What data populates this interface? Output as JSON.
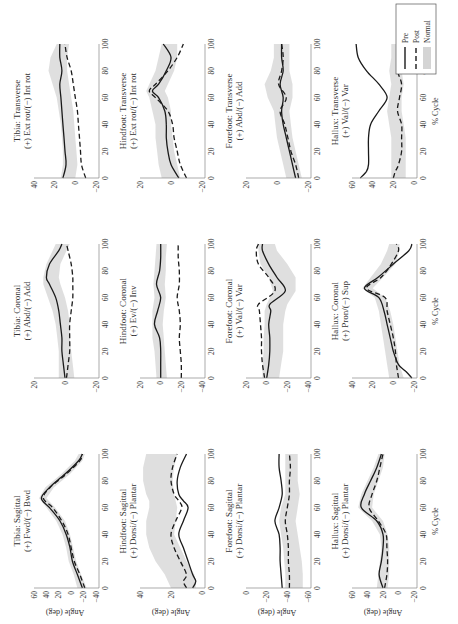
{
  "figure": {
    "legend": [
      {
        "label": "Pre",
        "style": "solid"
      },
      {
        "label": "Post",
        "style": "dashed"
      },
      {
        "label": "Normal",
        "style": "band"
      }
    ],
    "ylabel": "Angle (deg)",
    "xlabel": "% Cycle",
    "colors": {
      "line": "#1a1a1a",
      "band": "#d4d4d4",
      "axis": "#888888"
    }
  },
  "chart_data": [
    {
      "type": "line",
      "title": "Tibia: Sagittal",
      "subtitle": "(+) Fwd/(−) Bwd",
      "xlabel": "",
      "ylabel": "Angle (deg)",
      "xlim": [
        0,
        100
      ],
      "ylim": [
        -40,
        60
      ],
      "xticks": [
        0,
        20,
        40,
        60,
        80,
        100
      ],
      "yticks": [
        60,
        40,
        20,
        0,
        -20,
        -40
      ],
      "x": [
        0,
        10,
        20,
        30,
        40,
        50,
        60,
        67,
        75,
        85,
        95,
        100
      ],
      "series": [
        {
          "name": "Pre",
          "values": [
            -18,
            -10,
            -2,
            2,
            8,
            18,
            35,
            48,
            35,
            10,
            -12,
            -18
          ]
        },
        {
          "name": "Post",
          "values": [
            -22,
            -14,
            -5,
            0,
            5,
            15,
            30,
            45,
            34,
            8,
            -14,
            -18
          ]
        }
      ],
      "normal_band": {
        "lower": [
          -25,
          -16,
          -8,
          -3,
          2,
          10,
          26,
          40,
          28,
          2,
          -18,
          -22
        ],
        "upper": [
          -10,
          -4,
          4,
          8,
          14,
          24,
          40,
          52,
          42,
          16,
          -6,
          -12
        ]
      }
    },
    {
      "type": "line",
      "title": "Tibia: Coronal",
      "subtitle": "(+) Abd/(−) Add",
      "xlim": [
        0,
        100
      ],
      "ylim": [
        -20,
        20
      ],
      "xticks": [
        0,
        20,
        40,
        60,
        80,
        100
      ],
      "yticks": [
        20,
        0,
        -20
      ],
      "x": [
        0,
        10,
        20,
        30,
        40,
        50,
        60,
        70,
        75,
        85,
        95,
        100
      ],
      "series": [
        {
          "name": "Pre",
          "values": [
            0,
            1,
            2,
            2,
            3,
            4,
            6,
            10,
            12,
            10,
            4,
            2
          ]
        },
        {
          "name": "Post",
          "values": [
            -1,
            -2,
            -3,
            -3,
            -3,
            -4,
            -5,
            -5,
            -5,
            -4,
            -2,
            -1
          ]
        }
      ],
      "normal_band": {
        "lower": [
          -6,
          -5,
          -4,
          -3,
          -3,
          -2,
          0,
          3,
          4,
          3,
          -1,
          -3
        ],
        "upper": [
          4,
          4,
          4,
          5,
          6,
          8,
          11,
          14,
          14,
          12,
          8,
          6
        ]
      }
    },
    {
      "type": "line",
      "title": "Tibia: Transverse",
      "subtitle": "(+) Ext rot/(−) Int rot",
      "xlim": [
        0,
        100
      ],
      "ylim": [
        -20,
        40
      ],
      "xticks": [
        0,
        20,
        40,
        60,
        80,
        100
      ],
      "yticks": [
        40,
        20,
        0,
        -20
      ],
      "x": [
        0,
        10,
        20,
        30,
        40,
        50,
        60,
        70,
        80,
        90,
        100
      ],
      "series": [
        {
          "name": "Pre",
          "values": [
            12,
            9,
            10,
            11,
            12,
            13,
            14,
            15,
            13,
            15,
            15
          ]
        },
        {
          "name": "Post",
          "values": [
            -10,
            -6,
            -5,
            -4,
            -3,
            -2,
            0,
            2,
            4,
            8,
            10
          ]
        }
      ],
      "normal_band": {
        "lower": [
          0,
          -2,
          -1,
          0,
          1,
          2,
          4,
          6,
          8,
          8,
          6
        ],
        "upper": [
          14,
          12,
          12,
          13,
          14,
          16,
          18,
          22,
          26,
          24,
          18
        ]
      }
    },
    {
      "type": "line",
      "title": "Hindfoot: Sagittal",
      "subtitle": "(+) Dorsi/(−) Plantar",
      "xlim": [
        0,
        100
      ],
      "ylim": [
        0,
        40
      ],
      "xticks": [
        0,
        20,
        40,
        60,
        80,
        100
      ],
      "yticks": [
        40,
        20,
        0
      ],
      "x": [
        0,
        5,
        10,
        20,
        30,
        40,
        50,
        60,
        65,
        70,
        80,
        90,
        100
      ],
      "series": [
        {
          "name": "Pre",
          "values": [
            6,
            4,
            6,
            9,
            12,
            15,
            12,
            9,
            12,
            15,
            16,
            14,
            10
          ]
        },
        {
          "name": "Post",
          "values": [
            10,
            12,
            10,
            14,
            18,
            20,
            17,
            13,
            15,
            18,
            20,
            19,
            16
          ]
        }
      ],
      "normal_band": {
        "lower": [
          4,
          4,
          5,
          10,
          14,
          18,
          17,
          16,
          17,
          18,
          19,
          18,
          16
        ],
        "upper": [
          20,
          22,
          24,
          30,
          34,
          36,
          36,
          34,
          34,
          36,
          38,
          38,
          36
        ]
      }
    },
    {
      "type": "line",
      "title": "Hindfoot: Coronal",
      "subtitle": "(+) Ev/(−) Inv",
      "xlim": [
        0,
        100
      ],
      "ylim": [
        -40,
        20
      ],
      "xticks": [
        0,
        20,
        40,
        60,
        80,
        100
      ],
      "yticks": [
        20,
        0,
        -20,
        -40
      ],
      "x": [
        0,
        10,
        20,
        30,
        40,
        50,
        60,
        70,
        80,
        90,
        100
      ],
      "series": [
        {
          "name": "Pre",
          "values": [
            0,
            0,
            0,
            1,
            6,
            3,
            0,
            4,
            1,
            0,
            0
          ]
        },
        {
          "name": "Post",
          "values": [
            -20,
            -20,
            -19,
            -18,
            -19,
            -18,
            -16,
            -18,
            -18,
            -17,
            -17
          ]
        }
      ],
      "normal_band": {
        "lower": [
          -6,
          -5,
          -4,
          -3,
          -2,
          -3,
          -5,
          -4,
          -5,
          -5,
          -6
        ],
        "upper": [
          4,
          5,
          6,
          8,
          8,
          8,
          6,
          7,
          6,
          5,
          4
        ]
      }
    },
    {
      "type": "line",
      "title": "Hindfoot: Transverse",
      "subtitle": "(+) Ext rot/(−) Int rot",
      "xlim": [
        0,
        100
      ],
      "ylim": [
        -20,
        20
      ],
      "xticks": [
        0,
        20,
        40,
        60,
        80,
        100
      ],
      "yticks": [
        20,
        0,
        -20
      ],
      "x": [
        0,
        10,
        20,
        30,
        40,
        50,
        60,
        65,
        70,
        80,
        90,
        100
      ],
      "series": [
        {
          "name": "Pre",
          "values": [
            -5,
            0,
            2,
            3,
            3,
            4,
            8,
            12,
            8,
            3,
            0,
            5
          ]
        },
        {
          "name": "Post",
          "values": [
            -10,
            -6,
            -4,
            -2,
            -1,
            2,
            10,
            14,
            10,
            2,
            -4,
            -8
          ]
        }
      ],
      "normal_band": {
        "lower": [
          -6,
          -4,
          -2,
          -1,
          0,
          0,
          2,
          4,
          2,
          -2,
          -4,
          -4
        ],
        "upper": [
          6,
          8,
          9,
          10,
          10,
          12,
          14,
          16,
          14,
          10,
          8,
          6
        ]
      }
    },
    {
      "type": "line",
      "title": "Forefoot: Sagittal",
      "subtitle": "(+) Dorsi/(−) Plantar",
      "xlim": [
        0,
        100
      ],
      "ylim": [
        -60,
        0
      ],
      "xticks": [
        0,
        20,
        40,
        60,
        80,
        100
      ],
      "yticks": [
        0,
        -20,
        -40,
        -60
      ],
      "x": [
        0,
        10,
        20,
        30,
        40,
        50,
        60,
        70,
        80,
        90,
        100
      ],
      "series": [
        {
          "name": "Pre",
          "values": [
            -35,
            -34,
            -33,
            -33,
            -32,
            -28,
            -32,
            -35,
            -34,
            -32,
            -32
          ]
        },
        {
          "name": "Post",
          "values": [
            -42,
            -42,
            -41,
            -41,
            -40,
            -38,
            -40,
            -42,
            -42,
            -43,
            -42
          ]
        }
      ],
      "normal_band": {
        "lower": [
          -55,
          -55,
          -54,
          -52,
          -50,
          -48,
          -50,
          -52,
          -50,
          -50,
          -50
        ],
        "upper": [
          -38,
          -38,
          -37,
          -36,
          -34,
          -32,
          -34,
          -38,
          -38,
          -38,
          -38
        ]
      }
    },
    {
      "type": "line",
      "title": "Forefoot: Coronal",
      "subtitle": "(+) Val/(−) Var",
      "xlim": [
        0,
        100
      ],
      "ylim": [
        -40,
        20
      ],
      "xticks": [
        0,
        20,
        40,
        60,
        80,
        100
      ],
      "yticks": [
        20,
        0,
        -20,
        -40
      ],
      "x": [
        0,
        10,
        20,
        30,
        40,
        50,
        55,
        65,
        75,
        85,
        95,
        100
      ],
      "series": [
        {
          "name": "Pre",
          "values": [
            0,
            -2,
            -3,
            -3,
            -2,
            -4,
            -3,
            -18,
            -10,
            -2,
            4,
            4
          ]
        },
        {
          "name": "Post",
          "values": [
            2,
            4,
            5,
            5,
            6,
            7,
            8,
            -8,
            -2,
            8,
            10,
            8
          ]
        }
      ],
      "normal_band": {
        "lower": [
          -12,
          -14,
          -16,
          -16,
          -16,
          -18,
          -20,
          -28,
          -28,
          -20,
          -10,
          -8
        ],
        "upper": [
          4,
          4,
          3,
          3,
          2,
          2,
          0,
          -6,
          -2,
          6,
          8,
          8
        ]
      }
    },
    {
      "type": "line",
      "title": "Forefoot: Transverse",
      "subtitle": "(+) Abd/(−) Add",
      "xlim": [
        0,
        100
      ],
      "ylim": [
        -20,
        20
      ],
      "xticks": [
        0,
        20,
        40,
        60,
        80,
        100
      ],
      "yticks": [
        20,
        0,
        -20
      ],
      "x": [
        0,
        10,
        20,
        30,
        40,
        50,
        60,
        70,
        80,
        90,
        100
      ],
      "series": [
        {
          "name": "Pre",
          "values": [
            -12,
            -10,
            -8,
            -6,
            -4,
            -3,
            -4,
            -2,
            -4,
            -3,
            -3
          ]
        },
        {
          "name": "Post",
          "values": [
            -14,
            -12,
            -9,
            -7,
            -5,
            -2,
            -6,
            -1,
            -3,
            -4,
            -3
          ]
        }
      ],
      "normal_band": {
        "lower": [
          -16,
          -14,
          -12,
          -10,
          -9,
          -8,
          -10,
          -10,
          -8,
          -8,
          -8
        ],
        "upper": [
          -6,
          -4,
          -2,
          0,
          1,
          2,
          6,
          8,
          4,
          2,
          2
        ]
      }
    },
    {
      "type": "line",
      "title": "Hallux: Sagittal",
      "subtitle": "(+) Dorsi/(−) Plantar",
      "xlabel": "% Cycle",
      "ylabel": "Angle (deg)",
      "xlim": [
        0,
        100
      ],
      "ylim": [
        -20,
        60
      ],
      "xticks": [
        0,
        20,
        40,
        60,
        80,
        100
      ],
      "yticks": [
        60,
        40,
        20,
        0,
        -20
      ],
      "x": [
        0,
        10,
        20,
        30,
        40,
        50,
        60,
        70,
        80,
        90,
        100
      ],
      "series": [
        {
          "name": "Pre",
          "values": [
            20,
            25,
            22,
            20,
            20,
            28,
            48,
            44,
            36,
            28,
            22
          ]
        },
        {
          "name": "Post",
          "values": [
            18,
            15,
            14,
            15,
            16,
            26,
            38,
            34,
            28,
            24,
            20
          ]
        }
      ],
      "normal_band": {
        "lower": [
          14,
          12,
          12,
          12,
          14,
          20,
          34,
          32,
          26,
          20,
          18
        ],
        "upper": [
          28,
          26,
          24,
          22,
          24,
          34,
          52,
          48,
          40,
          32,
          26
        ]
      }
    },
    {
      "type": "line",
      "title": "Hallux: Coronal",
      "subtitle": "(+) Pron/(−) Sup",
      "xlabel": "% Cycle",
      "xlim": [
        0,
        100
      ],
      "ylim": [
        -20,
        40
      ],
      "xticks": [
        0,
        20,
        40,
        60,
        80,
        100
      ],
      "yticks": [
        40,
        20,
        0,
        -20
      ],
      "x": [
        0,
        5,
        10,
        20,
        30,
        40,
        50,
        60,
        67,
        75,
        85,
        95,
        100
      ],
      "series": [
        {
          "name": "Pre",
          "values": [
            -18,
            -12,
            -5,
            0,
            3,
            6,
            9,
            14,
            28,
            15,
            0,
            -15,
            -18
          ]
        },
        {
          "name": "Post",
          "values": [
            -5,
            -4,
            -3,
            -2,
            0,
            3,
            6,
            8,
            26,
            12,
            2,
            -5,
            -3
          ]
        }
      ],
      "normal_band": {
        "lower": [
          -10,
          -8,
          -6,
          -4,
          -2,
          0,
          3,
          8,
          20,
          10,
          -2,
          -6,
          -6
        ],
        "upper": [
          4,
          5,
          6,
          8,
          10,
          12,
          14,
          18,
          30,
          22,
          12,
          6,
          4
        ]
      }
    },
    {
      "type": "line",
      "title": "Hallux: Transverse",
      "subtitle": "(+) Val/(−) Var",
      "xlabel": "% Cycle",
      "xlim": [
        0,
        100
      ],
      "ylim": [
        0,
        60
      ],
      "xticks": [
        0,
        20,
        40,
        60,
        80,
        100
      ],
      "yticks": [
        60,
        40,
        20,
        0
      ],
      "x": [
        0,
        5,
        10,
        20,
        30,
        40,
        50,
        60,
        70,
        80,
        90,
        100
      ],
      "series": [
        {
          "name": "Pre",
          "values": [
            52,
            46,
            44,
            44,
            44,
            42,
            34,
            26,
            34,
            46,
            54,
            56
          ]
        },
        {
          "name": "Post",
          "values": [
            20,
            18,
            15,
            12,
            12,
            12,
            16,
            14,
            12,
            16,
            16,
            16
          ]
        }
      ],
      "normal_band": {
        "lower": [
          8,
          8,
          8,
          8,
          8,
          10,
          12,
          12,
          10,
          12,
          12,
          12
        ],
        "upper": [
          22,
          22,
          22,
          22,
          22,
          24,
          26,
          24,
          22,
          24,
          22,
          22
        ]
      }
    }
  ]
}
